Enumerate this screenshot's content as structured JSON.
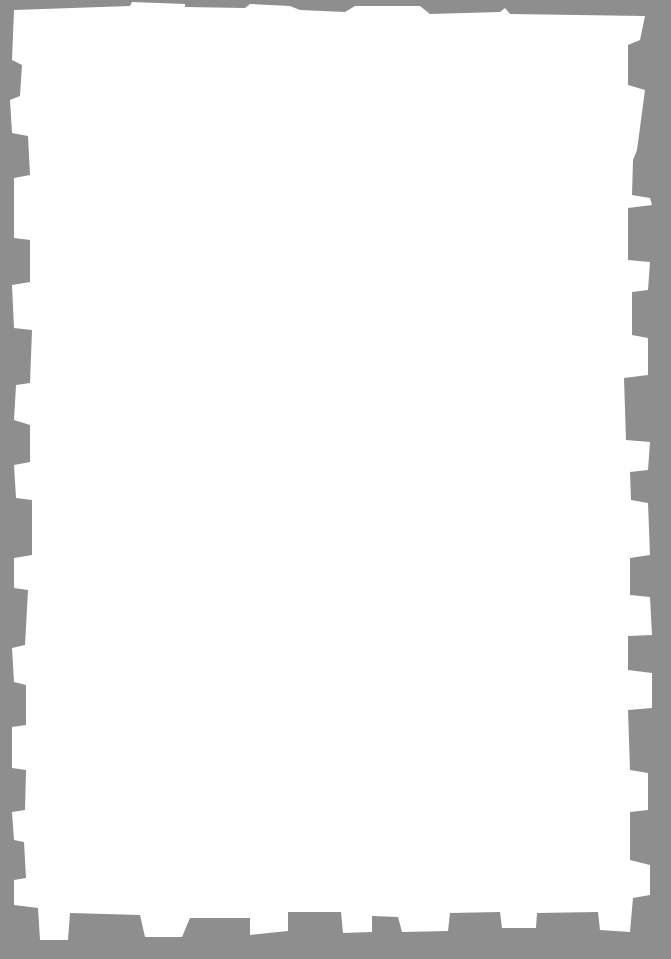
{
  "canvas": {
    "width": 671,
    "height": 959
  },
  "colors": {
    "border": "#8e8e8e",
    "paper": "#ffffff"
  },
  "frame": {
    "style": "notched-stamp-border",
    "paper_polygon": "14,10 130,6 132,2 185,4 185,7 245,8 250,4 290,6 300,10 345,12 355,6 420,6 430,14 500,12 505,8 510,14 645,16 640,40 628,45 628,85 645,90 637,150 633,160 632,195 650,198 652,205 628,208 628,260 650,262 648,290 632,292 632,335 648,338 648,375 624,378 626,440 650,442 648,470 630,472 631,500 648,503 650,555 630,558 630,595 650,597 652,635 628,636 628,670 652,673 652,708 628,710 630,770 648,773 648,810 630,812 630,860 650,865 650,895 633,898 630,932 600,930 598,912 537,913 536,928 502,928 500,912 450,913 448,931 402,932 398,917 372,916 372,932 343,933 341,912 288,912 288,931 250,935 250,918 190,918 182,937 145,937 140,915 70,913 68,940 40,940 38,908 14,905 14,880 26,878 24,842 14,840 12,812 25,810 26,770 12,768 12,727 26,725 26,685 14,682 12,648 25,645 28,590 14,588 14,558 32,555 32,500 16,498 14,465 30,462 30,425 14,420 16,385 30,383 32,330 14,328 12,285 30,282 30,240 14,238 14,178 30,175 28,136 12,133 10,100 20,96 22,65 12,60"
  }
}
